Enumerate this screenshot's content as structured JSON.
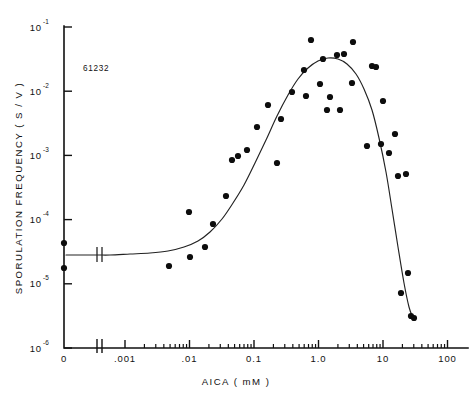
{
  "figure": {
    "code_label": "61232",
    "background": "#ffffff",
    "ink_color": "#111111",
    "point_color": "#0d0d0d"
  },
  "chart_data": {
    "type": "scatter",
    "title": "",
    "subtitle": "",
    "xlabel": "AICA   ( mM )",
    "ylabel": "SPORULATION  FREQUENCY  ( S / V )",
    "xscale": "log",
    "yscale": "log",
    "xlim": [
      0.001,
      100
    ],
    "ylim": [
      1e-06,
      0.1
    ],
    "grid": false,
    "legend": null,
    "axis_break": {
      "present": true,
      "between": [
        "0",
        ".001"
      ],
      "note": "zero point plotted left of break"
    },
    "xticks": [
      {
        "value": 0,
        "label": "0",
        "type": "zero"
      },
      {
        "value": 0.001,
        "label": ".001",
        "type": "major"
      },
      {
        "value": 0.01,
        "label": ".01",
        "type": "major"
      },
      {
        "value": 0.1,
        "label": "0.1",
        "type": "major"
      },
      {
        "value": 1.0,
        "label": "1.0",
        "type": "major"
      },
      {
        "value": 10,
        "label": "10",
        "type": "major"
      },
      {
        "value": 100,
        "label": "100",
        "type": "major"
      }
    ],
    "yticks": [
      {
        "value": 0.1,
        "mantissa": "10",
        "exponent": "-1"
      },
      {
        "value": 0.01,
        "mantissa": "10",
        "exponent": "-2"
      },
      {
        "value": 0.001,
        "mantissa": "10",
        "exponent": "-3"
      },
      {
        "value": 0.0001,
        "mantissa": "10",
        "exponent": "-4"
      },
      {
        "value": 1e-05,
        "mantissa": "10",
        "exponent": "-5"
      },
      {
        "value": 1e-06,
        "mantissa": "10",
        "exponent": "-6"
      }
    ],
    "series": [
      {
        "name": "sporulation frequency vs AICA",
        "marker": "filled-circle",
        "marker_size_px": 4.0,
        "points_px": [
          [
            64,
            243
          ],
          [
            64,
            268
          ],
          [
            169,
            266
          ],
          [
            190,
            257
          ],
          [
            205,
            247
          ],
          [
            189,
            212
          ],
          [
            213,
            224
          ],
          [
            226,
            196
          ],
          [
            232,
            160
          ],
          [
            238,
            156
          ],
          [
            247,
            150
          ],
          [
            257,
            127
          ],
          [
            268,
            105
          ],
          [
            277,
            163
          ],
          [
            281,
            119
          ],
          [
            292,
            92
          ],
          [
            304,
            70
          ],
          [
            311,
            40
          ],
          [
            306,
            96
          ],
          [
            320,
            84
          ],
          [
            323,
            59
          ],
          [
            330,
            97
          ],
          [
            337,
            55
          ],
          [
            344,
            54
          ],
          [
            327,
            110
          ],
          [
            340,
            110
          ],
          [
            353,
            42
          ],
          [
            352,
            83
          ],
          [
            367,
            146
          ],
          [
            372,
            66
          ],
          [
            376,
            67
          ],
          [
            383,
            101
          ],
          [
            381,
            144
          ],
          [
            389,
            153
          ],
          [
            395,
            134
          ],
          [
            398,
            176
          ],
          [
            406,
            174
          ],
          [
            401,
            293
          ],
          [
            408,
            273
          ],
          [
            411,
            316
          ],
          [
            414,
            318
          ]
        ]
      }
    ],
    "fit_curve_px": [
      [
        66,
        255
      ],
      [
        96,
        255
      ],
      [
        110,
        255
      ],
      [
        130,
        254
      ],
      [
        150,
        253
      ],
      [
        168,
        251
      ],
      [
        184,
        247
      ],
      [
        198,
        241
      ],
      [
        210,
        232
      ],
      [
        222,
        219
      ],
      [
        233,
        203
      ],
      [
        244,
        185
      ],
      [
        255,
        163
      ],
      [
        266,
        140
      ],
      [
        277,
        116
      ],
      [
        288,
        95
      ],
      [
        298,
        79
      ],
      [
        308,
        68
      ],
      [
        318,
        61
      ],
      [
        328,
        58
      ],
      [
        338,
        59
      ],
      [
        347,
        64
      ],
      [
        356,
        74
      ],
      [
        364,
        89
      ],
      [
        372,
        110
      ],
      [
        379,
        138
      ],
      [
        386,
        172
      ],
      [
        392,
        209
      ],
      [
        398,
        247
      ],
      [
        404,
        283
      ],
      [
        409,
        307
      ],
      [
        413,
        318
      ]
    ]
  }
}
